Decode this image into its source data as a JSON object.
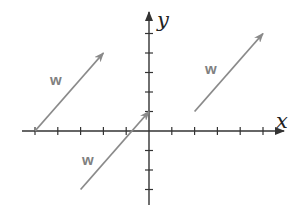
{
  "diagram": {
    "title": "",
    "axes": {
      "x_label": "x",
      "y_label": "y",
      "x_ticks_left": 5,
      "x_ticks_right": 5,
      "y_ticks_up": 5,
      "y_ticks_down": 3
    },
    "vectors": [
      {
        "label": "w",
        "tail": [
          -5,
          0
        ],
        "head": [
          -2,
          4
        ]
      },
      {
        "label": "w",
        "tail": [
          -3,
          -3
        ],
        "head": [
          0,
          1
        ]
      },
      {
        "label": "w",
        "tail": [
          2,
          1
        ],
        "head": [
          5,
          5
        ]
      }
    ],
    "colors": {
      "axis": "#333333",
      "vector": "#8a8a8a",
      "vector_label": "#808080"
    }
  }
}
